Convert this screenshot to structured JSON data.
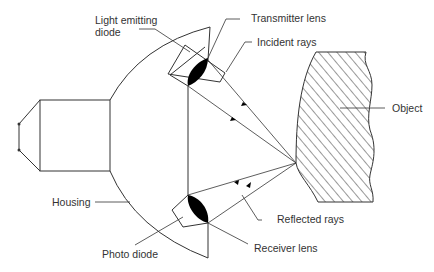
{
  "diagram": {
    "title": "",
    "type": "proximity sensor (reflective) schematic",
    "colors": {
      "line": "#333333",
      "fill": "#000000",
      "background": "#ffffff"
    },
    "labels": {
      "led_line1": "Light emitting",
      "led_line2": "diode",
      "transmitter_lens": "Transmitter lens",
      "incident_rays": "Incident  rays",
      "object": "Object",
      "housing": "Housing",
      "reflected_rays": "Reflected rays",
      "photo_diode": "Photo diode",
      "receiver_lens": "Receiver lens"
    },
    "components": [
      {
        "id": "connector",
        "label": ""
      },
      {
        "id": "housing",
        "label": "Housing"
      },
      {
        "id": "light-emitting-diode",
        "label": "Light emitting diode"
      },
      {
        "id": "transmitter-lens",
        "label": "Transmitter lens"
      },
      {
        "id": "receiver-lens",
        "label": "Receiver lens"
      },
      {
        "id": "photo-diode",
        "label": "Photo diode"
      },
      {
        "id": "object",
        "label": "Object"
      }
    ],
    "edges": [
      {
        "from": "transmitter-lens",
        "to": "object",
        "label": "Incident rays",
        "arrow": "forward"
      },
      {
        "from": "object",
        "to": "receiver-lens",
        "label": "Reflected rays",
        "arrow": "forward"
      }
    ]
  }
}
